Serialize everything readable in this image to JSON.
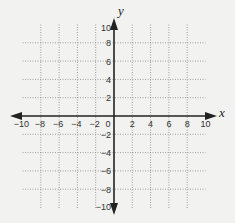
{
  "chart_data": {
    "type": "scatter",
    "title": "",
    "xlabel": "x",
    "ylabel": "y",
    "xlim": [
      -10,
      10
    ],
    "ylim": [
      -10,
      10
    ],
    "grid": true,
    "grid_style": "dotted",
    "grid_step": 2,
    "x_ticks": [
      -10,
      -8,
      -6,
      -4,
      -2,
      0,
      2,
      4,
      6,
      8,
      10
    ],
    "x_tick_labels": [
      "−10",
      "−8",
      "−6",
      "−4",
      "−2",
      "0",
      "2",
      "4",
      "6",
      "8",
      "10"
    ],
    "y_ticks": [
      10,
      8,
      6,
      4,
      2,
      -2,
      -4,
      -6,
      -8,
      -10
    ],
    "y_tick_labels": [
      "10",
      "8",
      "6",
      "4",
      "2",
      "−2",
      "−4",
      "−6",
      "−8",
      "−10"
    ],
    "series": [],
    "legend": null
  },
  "colors": {
    "background": "#f2f2f0",
    "axis": "#222222",
    "grid": "#8a8a8a",
    "text": "#333333"
  }
}
